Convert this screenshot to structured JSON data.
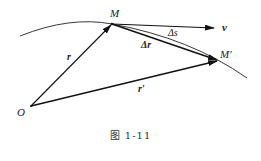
{
  "diagram": {
    "points": {
      "O": {
        "label": "O",
        "x": 31,
        "y": 106
      },
      "M": {
        "label": "M",
        "x": 112,
        "y": 24
      },
      "M_prime": {
        "label": "M′",
        "x": 218,
        "y": 61
      }
    },
    "vectors": [
      {
        "name": "r",
        "label": "r",
        "from": "O",
        "to": "M"
      },
      {
        "name": "r_prime",
        "label": "r′",
        "from": "O",
        "to": "M′"
      },
      {
        "name": "delta_r",
        "label": "Δr",
        "from": "M",
        "to": "M′"
      },
      {
        "name": "v",
        "label": "v",
        "from": "M",
        "direction": "tangent"
      }
    ],
    "arc": {
      "label": "Δs",
      "from": "M",
      "to": "M′"
    },
    "labels": {
      "O": "O",
      "M": "M",
      "M_prime": "M′",
      "r": "r",
      "r_prime": "r′",
      "delta_r": "Δr",
      "delta_s": "Δs",
      "v": "v"
    }
  },
  "caption": "图  1-11"
}
